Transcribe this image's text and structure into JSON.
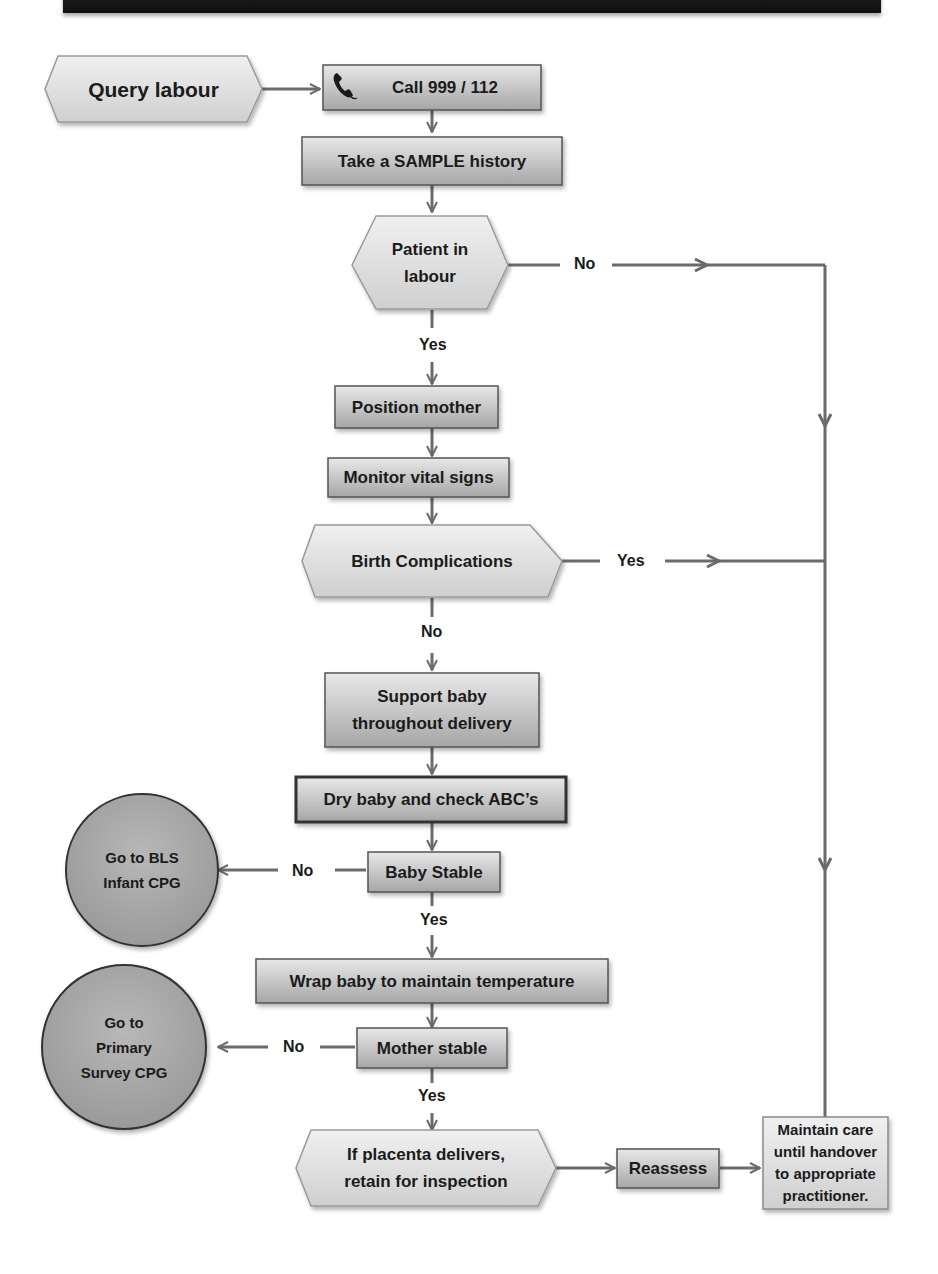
{
  "header": {
    "title": ""
  },
  "colors": {
    "box_fill_top": "#e6e6e6",
    "box_fill_bottom": "#a9a9a9",
    "line": "#6b6b6b",
    "circle_fill": "#a8a8a8",
    "text": "#1b1b1b",
    "banner": "#1a1a1a"
  },
  "nodes": {
    "query_labour": "Query labour",
    "call": "Call 999 / 112",
    "sample_history": "Take a SAMPLE history",
    "patient_in_labour_1": "Patient in",
    "patient_in_labour_2": "labour",
    "position_mother": "Position mother",
    "monitor_vitals": "Monitor vital signs",
    "birth_complications": "Birth Complications",
    "support_baby_1": "Support baby",
    "support_baby_2": "throughout delivery",
    "dry_baby": "Dry baby and check ABC’s",
    "baby_stable": "Baby Stable",
    "bls_1": "Go to BLS",
    "bls_2": "Infant CPG",
    "wrap_baby": "Wrap baby to maintain temperature",
    "mother_stable": "Mother stable",
    "primary_1": "Go to",
    "primary_2": "Primary",
    "primary_3": "Survey CPG",
    "placenta_1": "If placenta delivers,",
    "placenta_2": "retain for inspection",
    "reassess": "Reassess",
    "maintain_1": "Maintain care",
    "maintain_2": "until handover",
    "maintain_3": "to appropriate",
    "maintain_4": "practitioner."
  },
  "edge_labels": {
    "labour_no": "No",
    "labour_yes": "Yes",
    "complications_yes": "Yes",
    "complications_no": "No",
    "baby_no": "No",
    "baby_yes": "Yes",
    "mother_no": "No",
    "mother_yes": "Yes"
  },
  "icons": {
    "call": "phone-icon"
  }
}
